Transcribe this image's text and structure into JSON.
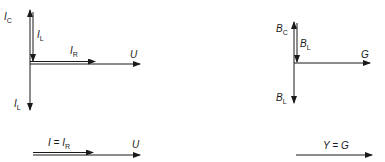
{
  "current_phasor_diagram": {
    "vertical_up_label": {
      "main": "I",
      "sub": "C"
    },
    "vertical_down_inner_label": {
      "main": "I",
      "sub": "L"
    },
    "vertical_down_label": {
      "main": "I",
      "sub": "L"
    },
    "horizontal_inner_label": {
      "main": "I",
      "sub": "R"
    },
    "horizontal_axis_label": "U"
  },
  "current_resultant": {
    "label_main": "I = I",
    "label_sub": "R",
    "axis_label": "U"
  },
  "admittance_phasor_diagram": {
    "vertical_up_label": {
      "main": "B",
      "sub": "C"
    },
    "vertical_down_inner_label": {
      "main": "B",
      "sub": "L"
    },
    "vertical_down_label": {
      "main": "B",
      "sub": "L"
    },
    "horizontal_axis_label": "G"
  },
  "admittance_resultant": {
    "label": "Y = G"
  },
  "colors": {
    "stroke": "#1a1a1a",
    "background": "#ffffff"
  }
}
